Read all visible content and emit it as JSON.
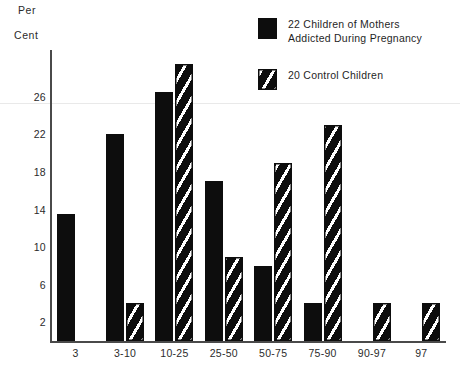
{
  "axis_titles": {
    "y_line1": "Per",
    "y_line2": "Cent"
  },
  "legend": {
    "series1_label_line1": "22 Children of Mothers",
    "series1_label_line2": "Addicted During Pregnancy",
    "series2_label_line1": "20 Control Children",
    "series2_label_line2": ""
  },
  "colors": {
    "bar_black": "#0d0d0d",
    "axis": "#4a4a4a",
    "background": "#ffffff",
    "text": "#1f1f1f"
  },
  "chart_data": {
    "type": "bar",
    "title": "",
    "subtitle": "",
    "xlabel": "",
    "ylabel": "Per Cent",
    "ylim": [
      0,
      31
    ],
    "yticks": [
      2,
      6,
      10,
      14,
      18,
      22,
      26
    ],
    "ytick_labels": [
      "2",
      "6",
      "10",
      "14",
      "18",
      "22",
      "26"
    ],
    "grid": false,
    "legend_position": "top-right",
    "categories": [
      "3",
      "3-10",
      "10-25",
      "25-50",
      "50-75",
      "75-90",
      "90-97",
      "97"
    ],
    "series": [
      {
        "name": "22 Children of Mothers Addicted During Pregnancy",
        "pattern": "solid",
        "values": [
          13.5,
          22,
          26.5,
          17,
          8,
          4,
          null,
          null
        ]
      },
      {
        "name": "20 Control Children",
        "pattern": "diagonal-hatch",
        "values": [
          null,
          4,
          29.5,
          9,
          19,
          23,
          4,
          4
        ]
      }
    ]
  }
}
